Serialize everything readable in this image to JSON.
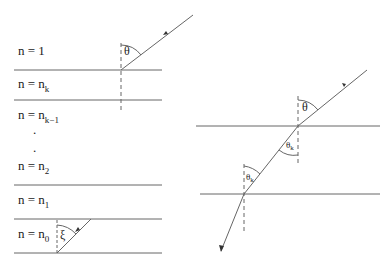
{
  "left_diagram": {
    "layers": [
      {
        "prefix": "n = 1",
        "sub": ""
      },
      {
        "prefix": "n = n",
        "sub": "k"
      },
      {
        "prefix": "n = n",
        "sub": "k−1"
      },
      {
        "prefix": "n = n",
        "sub": "2"
      },
      {
        "prefix": "n = n",
        "sub": "1"
      },
      {
        "prefix": "n = n",
        "sub": "0"
      }
    ],
    "ellipsis": [
      ".",
      "."
    ],
    "angle_top": "θ",
    "angle_bottom": "ξ"
  },
  "right_diagram": {
    "angle_top": "θ",
    "angle_mid_main": "θ",
    "angle_mid_sub": "k",
    "angle_low_main": "θ",
    "angle_low_sub": "k"
  },
  "colors": {
    "line": "#555555",
    "text": "#222222"
  }
}
